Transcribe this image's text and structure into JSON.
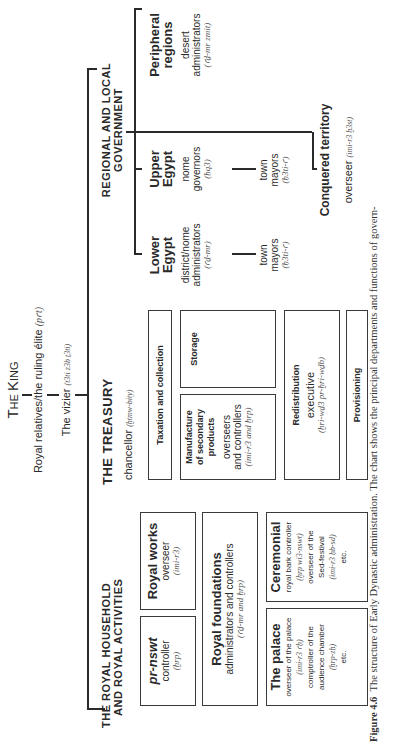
{
  "figure": {
    "title_small_caps": {
      "first": "T",
      "rest1": "HE ",
      "first2": "K",
      "rest2": "ING"
    },
    "royal_relatives": {
      "label": "Royal relatives/the ruling élite",
      "term": "(pꜥt)"
    },
    "vizier": {
      "label": "The vizier",
      "term": "(t3ti z3b ṯ3ti)"
    },
    "household": {
      "heading_line1": "THE ROYAL HOUSEHOLD",
      "heading_line2": "AND ROYAL ACTIVITIES",
      "boxes": [
        {
          "title": "pr-nswt",
          "lines": [
            "controller"
          ],
          "term": "(ḫrp)"
        },
        {
          "title": "Royal works",
          "lines": [
            "overseer"
          ],
          "term": "(imi-r3)"
        },
        {
          "title": "Royal foundations",
          "lines": [
            "administrators and controllers"
          ],
          "term": "(ꜥḏ-mr and ḫrp)"
        },
        {
          "title": "The palace",
          "lines": [
            "overseer of the palace",
            "(imi-r3 ꜥḥ)",
            "comptroller of the",
            "audience chamber",
            "(ḫrp-zḥ)",
            "etc."
          ]
        },
        {
          "title": "Ceremonial",
          "lines": [
            "royal bark controller",
            "(ḫrp wi3-nswt)",
            "overseer of the",
            "Sed-festival",
            "(imi-r3 ḥb-sd)",
            "etc."
          ]
        }
      ]
    },
    "treasury": {
      "heading": "THE TREASURY",
      "official": "chancellor",
      "official_term": "(ḫtmw-bity)",
      "boxes": [
        {
          "title": "Taxation and collection"
        },
        {
          "title": "Storage"
        },
        {
          "title_lines": [
            "Manufacture",
            "of secondary",
            "products"
          ],
          "lines": [
            "overseers",
            "and controllers"
          ],
          "term": "(imi-r3 and ḫrp)"
        },
        {
          "title": "Redistribution",
          "lines": [
            "executive"
          ],
          "term": "(ḫri-wḏ3 pr-ḫri-wḏb)"
        },
        {
          "title": "Provisioning"
        }
      ]
    },
    "regional": {
      "heading_line1": "REGIONAL AND LOCAL",
      "heading_line2": "GOVERNMENT",
      "columns": [
        {
          "title_lines": [
            "Lower",
            "Egypt"
          ],
          "lines": [
            "district/nome",
            "administrators"
          ],
          "term": "(ꜥḏ-mr)",
          "sub": {
            "lines": [
              "town",
              "mayors"
            ],
            "term": "(ḥ3ti-ꜥ)"
          }
        },
        {
          "title_lines": [
            "Upper",
            "Egypt"
          ],
          "lines": [
            "nome",
            "governors"
          ],
          "term": "(ḥq3)",
          "sub": {
            "lines": [
              "town",
              "mayors"
            ],
            "term": "(ḥ3ti-ꜥ)"
          }
        },
        {
          "title_lines": [
            "Peripheral",
            "regions"
          ],
          "lines": [
            "desert",
            "administrators"
          ],
          "term": "(ꜥḏ-mr zmit)"
        }
      ],
      "conquered": {
        "title": "Conquered territory",
        "official": "overseer",
        "term": "(imi-r3 ḫ3st)"
      }
    },
    "caption": {
      "label": "Figure 4.6",
      "text": "The structure of Early Dynastic administration. The chart shows the principal departments and functions of govern-"
    }
  }
}
